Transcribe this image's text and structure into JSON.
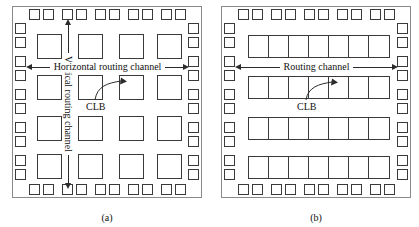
{
  "figure": {
    "panels": [
      {
        "id": "a",
        "caption": "(a)",
        "architecture": "island-style FPGA",
        "labels": {
          "horizontal_channel": "Horizontal routing channel",
          "vertical_channel": "Vertical routing channel",
          "clb": "CLB"
        },
        "clb_grid": {
          "rows": 4,
          "cols": 4
        },
        "io_pads": {
          "top": 10,
          "bottom": 10,
          "left": 10,
          "right": 10
        }
      },
      {
        "id": "b",
        "caption": "(b)",
        "architecture": "row-based FPGA",
        "labels": {
          "routing_channel": "Routing channel",
          "clb": "CLB"
        },
        "clb_rows": {
          "rows": 4,
          "cells_per_row": 7
        },
        "io_pads": {
          "top": 10,
          "bottom": 10,
          "left": 10,
          "right": 10
        }
      }
    ],
    "colors": {
      "chip_border": "#8a8a8a",
      "block_outline": "#3a3a3a",
      "arrow": "#2b2b2b",
      "text": "#111111",
      "background": "#ffffff"
    }
  }
}
